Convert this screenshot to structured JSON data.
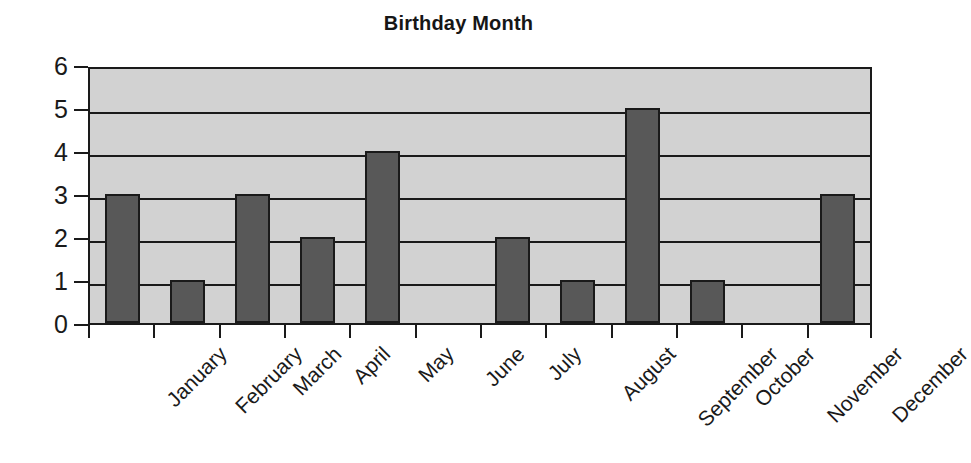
{
  "chart_data": {
    "type": "bar",
    "title": "Birthday Month",
    "xlabel": "",
    "ylabel": "",
    "categories": [
      "January",
      "February",
      "March",
      "April",
      "May",
      "June",
      "July",
      "August",
      "September",
      "October",
      "November",
      "December"
    ],
    "values": [
      3,
      1,
      3,
      2,
      4,
      0,
      2,
      1,
      5,
      1,
      0,
      3
    ],
    "ylim": [
      0,
      6
    ],
    "yticks": [
      "0",
      "1",
      "2",
      "3",
      "4",
      "5",
      "6"
    ],
    "grid": true,
    "legend": false,
    "legend_position": "none",
    "colors": {
      "bar_fill": "#585858",
      "bar_outline": "#1a1a1a",
      "plot_background": "#d2d2d2",
      "gridline": "#1a1a1a",
      "axis": "#1a1a1a",
      "text": "#1a1a1a",
      "figure_background": "#ffffff"
    }
  }
}
